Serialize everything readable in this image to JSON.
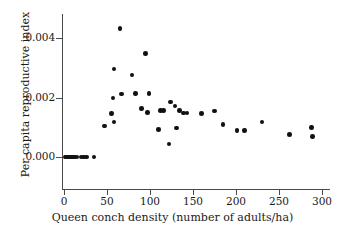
{
  "chart_data": {
    "type": "scatter",
    "title": "",
    "xlabel": "Queen conch density (number of adults/ha)",
    "ylabel": "Per capita reproductive index",
    "xlim": [
      -8,
      310
    ],
    "ylim": [
      -0.00055,
      0.00475
    ],
    "xticks": [
      0,
      50,
      100,
      150,
      200,
      250,
      300
    ],
    "xticklabels": [
      "0",
      "50",
      "100",
      "150",
      "200",
      "250",
      "300"
    ],
    "yticks": [
      0.0,
      0.002,
      0.004
    ],
    "yticklabels": [
      "0.000",
      "0.002",
      "0.004"
    ],
    "grid": false,
    "legend": null,
    "marker": "filled-circle",
    "marker_color": "#111111",
    "points": [
      {
        "x": 1,
        "y": 0.0
      },
      {
        "x": 3,
        "y": 0.0
      },
      {
        "x": 5,
        "y": 0.0
      },
      {
        "x": 7,
        "y": 0.0
      },
      {
        "x": 9,
        "y": 0.0
      },
      {
        "x": 11,
        "y": 0.0
      },
      {
        "x": 13,
        "y": 0.0
      },
      {
        "x": 15,
        "y": 0.0
      },
      {
        "x": 20,
        "y": 0.0
      },
      {
        "x": 23,
        "y": 0.0
      },
      {
        "x": 26,
        "y": 0.0
      },
      {
        "x": 35,
        "y": 0.0
      },
      {
        "x": 47,
        "y": 0.00104
      },
      {
        "x": 55,
        "y": 0.00146
      },
      {
        "x": 57,
        "y": 0.00198
      },
      {
        "x": 58,
        "y": 0.00118
      },
      {
        "x": 58,
        "y": 0.00296
      },
      {
        "x": 65,
        "y": 0.00432
      },
      {
        "x": 67,
        "y": 0.00212
      },
      {
        "x": 79,
        "y": 0.00276
      },
      {
        "x": 83,
        "y": 0.00213
      },
      {
        "x": 90,
        "y": 0.00164
      },
      {
        "x": 95,
        "y": 0.00347
      },
      {
        "x": 97,
        "y": 0.00149
      },
      {
        "x": 99,
        "y": 0.00213
      },
      {
        "x": 110,
        "y": 0.00092
      },
      {
        "x": 112,
        "y": 0.00157
      },
      {
        "x": 116,
        "y": 0.00157
      },
      {
        "x": 122,
        "y": 0.00044
      },
      {
        "x": 124,
        "y": 0.00185
      },
      {
        "x": 129,
        "y": 0.00171
      },
      {
        "x": 131,
        "y": 0.00098
      },
      {
        "x": 134,
        "y": 0.00157
      },
      {
        "x": 139,
        "y": 0.00148
      },
      {
        "x": 143,
        "y": 0.00148
      },
      {
        "x": 160,
        "y": 0.00146
      },
      {
        "x": 175,
        "y": 0.00155
      },
      {
        "x": 185,
        "y": 0.0011
      },
      {
        "x": 201,
        "y": 0.0009
      },
      {
        "x": 210,
        "y": 0.0009
      },
      {
        "x": 230,
        "y": 0.00117
      },
      {
        "x": 262,
        "y": 0.00076
      },
      {
        "x": 288,
        "y": 0.00099
      },
      {
        "x": 289,
        "y": 0.00069
      }
    ]
  }
}
